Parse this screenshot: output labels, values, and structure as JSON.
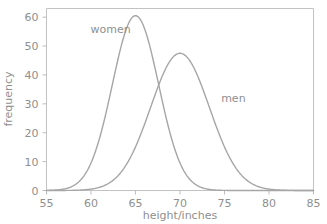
{
  "chart_data": {
    "type": "line",
    "title": "",
    "xlabel": "height/inches",
    "ylabel": "frequency",
    "xlim": [
      55,
      85
    ],
    "ylim": [
      0,
      63
    ],
    "xticks": [
      55,
      60,
      65,
      70,
      75,
      80,
      85
    ],
    "yticks": [
      0,
      10,
      20,
      30,
      40,
      50,
      60
    ],
    "grid": false,
    "legend_position": "inline-annotations",
    "curve_color": "#a6a6a6",
    "axis_color": "#c2c2c2",
    "text_color": "#8f8f8f",
    "background_color": "#ffffff",
    "series": [
      {
        "name": "women",
        "label": "women",
        "distribution": "normal",
        "mean": 65,
        "sigma": 2.6,
        "peak_value": 60.5,
        "label_x": 62.2,
        "label_y": 54.5,
        "x": [
          55,
          56,
          57,
          58,
          59,
          60,
          61,
          62,
          63,
          64,
          65,
          66,
          67,
          68,
          69,
          70,
          71,
          72,
          73,
          74,
          75,
          76,
          77,
          78,
          79,
          80,
          81,
          82,
          83,
          84,
          85
        ],
        "values": [
          0.1,
          0.3,
          0.8,
          1.9,
          4.1,
          8.1,
          14.6,
          24.1,
          36.3,
          50.1,
          60.5,
          60.5,
          50.1,
          36.3,
          24.1,
          14.6,
          8.1,
          4.1,
          1.9,
          0.8,
          0.3,
          0.1,
          0.0,
          0.0,
          0.0,
          0.0,
          0.0,
          0.0,
          0.0,
          0.0,
          0.0
        ]
      },
      {
        "name": "men",
        "label": "men",
        "distribution": "normal",
        "mean": 70,
        "sigma": 3.3,
        "peak_value": 47.5,
        "label_x": 76.0,
        "label_y": 30.5,
        "x": [
          55,
          56,
          57,
          58,
          59,
          60,
          61,
          62,
          63,
          64,
          65,
          66,
          67,
          68,
          69,
          70,
          71,
          72,
          73,
          74,
          75,
          76,
          77,
          78,
          79,
          80,
          81,
          82,
          83,
          84,
          85
        ],
        "values": [
          0.1,
          0.2,
          0.5,
          1.0,
          2.0,
          3.6,
          6.2,
          10.0,
          15.3,
          22.0,
          29.8,
          37.9,
          44.3,
          47.5,
          47.5,
          44.3,
          37.9,
          29.8,
          22.0,
          15.3,
          10.0,
          6.2,
          3.6,
          2.0,
          1.0,
          0.5,
          0.2,
          0.1,
          0.0,
          0.0,
          0.0
        ]
      }
    ]
  }
}
